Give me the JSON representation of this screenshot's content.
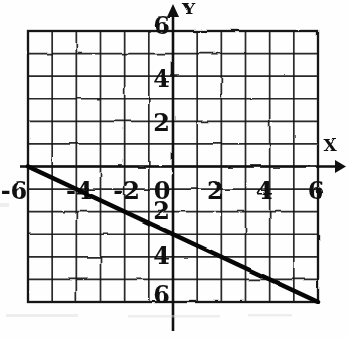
{
  "figure": {
    "kind": "scanned-graph",
    "background": "#fefefe",
    "ink_color": "#1c1c1c",
    "axis_color": "#141414",
    "plot_line_color": "#0d0d0d",
    "artifact_color": "#d6d6d6"
  },
  "chart_data": {
    "type": "line",
    "title": "",
    "xlabel": "X",
    "ylabel": "Y",
    "xlim": [
      -6,
      6
    ],
    "ylim": [
      -6,
      6
    ],
    "grid": true,
    "grid_step": 1,
    "legend": false,
    "x_ticks": [
      {
        "value": -6,
        "label": "-6"
      },
      {
        "value": -4,
        "label": "-4"
      },
      {
        "value": -2,
        "label": "-2"
      },
      {
        "value": 0,
        "label": "0"
      },
      {
        "value": 2,
        "label": "2"
      },
      {
        "value": 4,
        "label": "4"
      },
      {
        "value": 6,
        "label": "6"
      }
    ],
    "y_ticks": [
      {
        "value": 6,
        "label": "6"
      },
      {
        "value": 4,
        "label": "4"
      },
      {
        "value": 2,
        "label": "2"
      },
      {
        "value": -2,
        "label": "2"
      },
      {
        "value": -4,
        "label": "4"
      },
      {
        "value": -6,
        "label": "6"
      }
    ],
    "series": [
      {
        "name": "plotted-line",
        "points": [
          [
            -6,
            0
          ],
          [
            0,
            -3
          ],
          [
            6,
            -6
          ]
        ],
        "x_intercept": -6,
        "y_intercept": -3,
        "slope": -0.5
      }
    ]
  }
}
